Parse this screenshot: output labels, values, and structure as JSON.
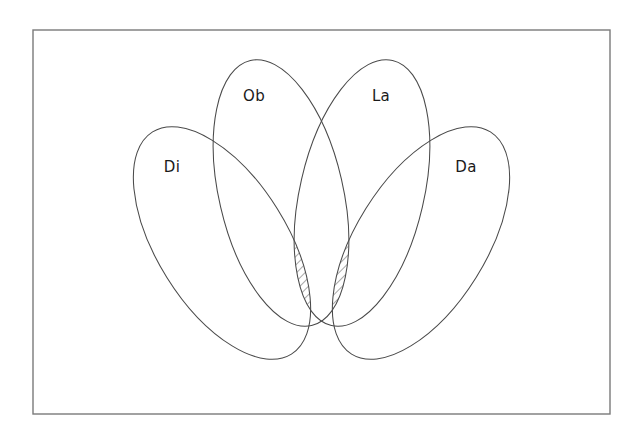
{
  "figure": {
    "kind": "venn-diagram",
    "set_count": 4,
    "background_color": "#ffffff",
    "stroke_color": "#4a4a4a",
    "frame_color": "#7a7a7a",
    "hatch_color": "#3c3c3c",
    "frame": {
      "x": 33,
      "y": 30,
      "width": 577,
      "height": 384
    }
  },
  "sets": [
    {
      "id": "di",
      "label": "Di",
      "label_x": 172,
      "label_y": 172,
      "ellipse": {
        "cx": 222,
        "cy": 243,
        "rx": 65,
        "ry": 131,
        "rotate": -32
      }
    },
    {
      "id": "ob",
      "label": "Ob",
      "label_x": 254,
      "label_y": 101,
      "ellipse": {
        "cx": 281,
        "cy": 193,
        "rx": 62,
        "ry": 136,
        "rotate": -13
      }
    },
    {
      "id": "la",
      "label": "La",
      "label_x": 381,
      "label_y": 101,
      "ellipse": {
        "cx": 362,
        "cy": 193,
        "rx": 62,
        "ry": 136,
        "rotate": 13
      }
    },
    {
      "id": "da",
      "label": "Da",
      "label_x": 466,
      "label_y": 172,
      "ellipse": {
        "cx": 421,
        "cy": 243,
        "rx": 65,
        "ry": 131,
        "rotate": 32
      }
    }
  ],
  "shaded_regions": [
    {
      "id": "di-ob-la",
      "description": "Di AND Ob AND La",
      "fill": "hatch-diagonal",
      "hatch_angle_degrees": 45,
      "hatch_spacing_px": 6
    },
    {
      "id": "ob-la-da",
      "description": "Ob AND La AND Da",
      "fill": "hatch-diagonal",
      "hatch_angle_degrees": 45,
      "hatch_spacing_px": 6
    }
  ]
}
